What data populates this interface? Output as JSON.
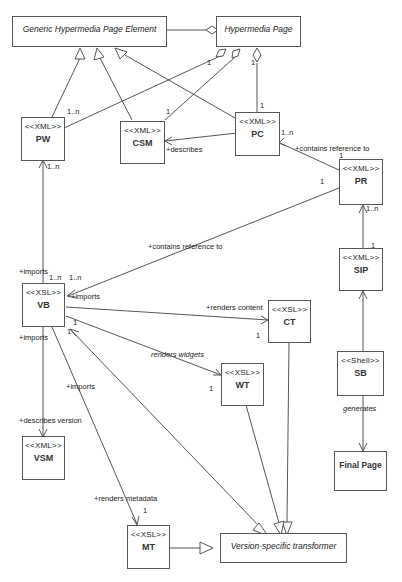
{
  "diagram": {
    "type": "UML class diagram",
    "classes": {
      "generic_element": {
        "label": "Generic Hypermedia Page Element",
        "abstract": true
      },
      "hypermedia_page": {
        "label": "Hypermedia Page",
        "abstract": true
      },
      "pw": {
        "stereotype": "<<XML>>",
        "name": "PW"
      },
      "csm": {
        "stereotype": "<<XML>>",
        "name": "CSM"
      },
      "pc": {
        "stereotype": "<<XML>>",
        "name": "PC"
      },
      "pr": {
        "stereotype": "<<XML>>",
        "name": "PR"
      },
      "sip": {
        "stereotype": "<<XML>>",
        "name": "SIP"
      },
      "vb": {
        "stereotype": "<<XSL>>",
        "name": "VB"
      },
      "ct": {
        "stereotype": "<<XSL>>",
        "name": "CT"
      },
      "wt": {
        "stereotype": "<<XSL>>",
        "name": "WT"
      },
      "sb": {
        "stereotype": "<<Shell>>",
        "name": "SB"
      },
      "vsm": {
        "stereotype": "<<XML>>",
        "name": "VSM"
      },
      "mt": {
        "stereotype": "<<XSL>>",
        "name": "MT"
      },
      "final_page": {
        "label": "Final Page"
      },
      "version_transformer": {
        "label": "Version-specific transformer",
        "abstract": true
      }
    },
    "labels": {
      "describes": "+describes",
      "contains_ref_pc": "+contains reference to",
      "contains_ref_vb": "+contains reference to",
      "imports_pw": "+imports",
      "imports_vb": "+imports",
      "imports_vsm": "+imports",
      "imports_mt": "+imports",
      "renders_content": "+renders content",
      "renders_widgets": "renders widgets",
      "describes_version": "+describes version",
      "generates": "generates",
      "renders_metadata": "+renders metadata"
    },
    "multiplicities": {
      "pw_top": "1..n",
      "csm_top": "1",
      "hp_diamond1": "1",
      "hp_pc_top": "1",
      "pc_top": "1",
      "pc_right": "1..n",
      "pr_top": "1",
      "pr_left": "1",
      "pr_bottom": "1..n",
      "sip_top": "1",
      "pw_bottom": "1..n",
      "vb_top1": "1..n",
      "vb_top2": "1..n",
      "vb_br1": "1",
      "vb_br2": "1",
      "ct_left": "1",
      "wt_left": "1",
      "mt_top": "1"
    }
  }
}
